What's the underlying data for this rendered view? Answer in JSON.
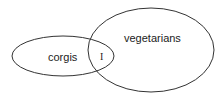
{
  "diagram": {
    "type": "venn",
    "sets": [
      {
        "id": "left",
        "label": "corgis",
        "shape": {
          "cx": 63,
          "cy": 56,
          "rx": 51,
          "ry": 20
        }
      },
      {
        "id": "right",
        "label": "vegetarians",
        "shape": {
          "cx": 151,
          "cy": 50,
          "rx": 63,
          "ry": 42
        }
      }
    ],
    "intersection": {
      "label": "I"
    },
    "stroke_color": "#333333",
    "background": "#ffffff"
  }
}
